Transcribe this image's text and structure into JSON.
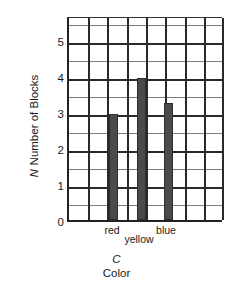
{
  "chart_data": {
    "type": "bar",
    "title": "",
    "categories": [
      "red",
      "yellow",
      "blue"
    ],
    "values": [
      3,
      4,
      3.3
    ],
    "xlabel": "Color",
    "xsymbol": "C",
    "ylabel": "Number of Blocks",
    "ysymbol": "N",
    "ylim": [
      0,
      5.7
    ],
    "yticks": [
      0,
      1,
      2,
      3,
      4,
      5
    ],
    "ytick_labels": [
      "0",
      "1",
      "2",
      "3",
      "4",
      "5"
    ],
    "minor_y_step": 0.5,
    "grid": true,
    "grid_x_columns": 8,
    "legend": "none",
    "bar_color": "#4a4a4a",
    "grid_color": "#3b3b3b",
    "axis_color": "#222222"
  },
  "axes": {
    "y_title_symbol": "N",
    "y_title_label": "Number of Blocks",
    "x_title_symbol": "C",
    "x_title_label": "Color"
  },
  "ytick_labels": {
    "t0": "0",
    "t1": "1",
    "t2": "2",
    "t3": "3",
    "t4": "4",
    "t5": "5"
  },
  "xtick_labels": {
    "red": "red",
    "yellow": "yellow",
    "blue": "blue"
  }
}
